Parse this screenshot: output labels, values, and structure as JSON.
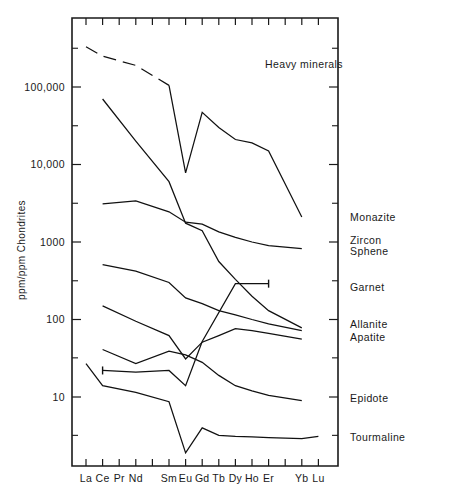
{
  "chart_data": {
    "type": "line",
    "title": "",
    "annotation": "Heavy minerals",
    "xlabel": "",
    "ylabel": "ppm/ppm Chondrites",
    "yscale": "log",
    "ylim": [
      1.5,
      600000
    ],
    "grid": false,
    "legend_position": "right-inline",
    "categories": [
      "La",
      "Ce",
      "Pr",
      "Nd",
      "Pm",
      "Sm",
      "Eu",
      "Gd",
      "Tb",
      "Dy",
      "Ho",
      "Er",
      "Tm",
      "Yb",
      "Lu"
    ],
    "tick_labels": [
      "La",
      "Ce",
      "Pr",
      "Nd",
      "",
      "Sm",
      "Eu",
      "Gd",
      "Tb",
      "Dy",
      "Ho",
      "Er",
      "",
      "Yb",
      "Lu"
    ],
    "y_tick_labels": [
      "100,000",
      "10,000",
      "1000",
      "100",
      "10"
    ],
    "y_tick_values": [
      100000,
      10000,
      1000,
      100,
      10
    ],
    "series": [
      {
        "name": "Monazite",
        "label": "Monazite",
        "dashed_head": true,
        "x": [
          "La",
          "Ce",
          "Nd",
          "Sm",
          "Eu",
          "Gd",
          "Tb",
          "Dy",
          "Ho",
          "Er",
          "Yb"
        ],
        "values": [
          330000,
          250000,
          190000,
          105000,
          7800,
          47000,
          30000,
          21000,
          19000,
          15000,
          2100
        ]
      },
      {
        "name": "Zircon",
        "label": "Zircon",
        "dashed_head": false,
        "x": [
          "Ce",
          "Nd",
          "Sm",
          "Eu",
          "Gd",
          "Tb",
          "Dy",
          "Ho",
          "Er",
          "Yb"
        ],
        "values": [
          70000,
          20000,
          6000,
          1750,
          1400,
          560,
          330,
          200,
          130,
          78
        ]
      },
      {
        "name": "Sphene",
        "label": "Sphene",
        "dashed_head": false,
        "x": [
          "Ce",
          "Nd",
          "Sm",
          "Eu",
          "Gd",
          "Tb",
          "Dy",
          "Ho",
          "Er",
          "Yb"
        ],
        "values": [
          3100,
          3400,
          2450,
          1800,
          1700,
          1350,
          1150,
          1000,
          900,
          820
        ]
      },
      {
        "name": "Garnet",
        "label": "Garnet",
        "dashed_head": false,
        "x": [
          "Ce",
          "Nd",
          "Sm",
          "Eu",
          "Gd",
          "Dy",
          "Er"
        ],
        "values": [
          22,
          21,
          22,
          14,
          52,
          290,
          290
        ],
        "has_endcap": true
      },
      {
        "name": "Allanite",
        "label": "Allanite",
        "dashed_head": false,
        "x": [
          "Ce",
          "Nd",
          "Sm",
          "Eu",
          "Gd",
          "Tb",
          "Dy",
          "Ho",
          "Er",
          "Yb"
        ],
        "values": [
          510,
          420,
          300,
          190,
          160,
          130,
          115,
          100,
          88,
          72
        ]
      },
      {
        "name": "Apatite",
        "label": "Apatite",
        "dashed_head": false,
        "x": [
          "Ce",
          "Nd",
          "Sm",
          "Eu",
          "Gd",
          "Tb",
          "Dy",
          "Ho",
          "Er",
          "Yb"
        ],
        "values": [
          150,
          95,
          62,
          31,
          51,
          62,
          76,
          72,
          66,
          56
        ]
      },
      {
        "name": "Epidote",
        "label": "Epidote",
        "dashed_head": false,
        "x": [
          "Ce",
          "Nd",
          "Sm",
          "Eu",
          "Gd",
          "Tb",
          "Dy",
          "Ho",
          "Er",
          "Yb"
        ],
        "values": [
          41,
          27,
          39,
          35,
          28,
          19,
          14,
          12,
          10.5,
          9
        ]
      },
      {
        "name": "Tourmaline",
        "label": "Tourmaline",
        "dashed_head": false,
        "x": [
          "La",
          "Ce",
          "Nd",
          "Sm",
          "Eu",
          "Gd",
          "Tb",
          "Dy",
          "Ho",
          "Er",
          "Yb",
          "Lu"
        ],
        "values": [
          27,
          14,
          11.5,
          8.7,
          1.9,
          4.0,
          3.2,
          3.1,
          3.05,
          3.0,
          2.9,
          3.1
        ]
      }
    ],
    "series_labels": [
      {
        "text": "Monazite",
        "y_value": 2100
      },
      {
        "text": "Zircon",
        "y_value": 1050
      },
      {
        "text": "Sphene",
        "y_value": 760
      },
      {
        "text": "Garnet",
        "y_value": 260
      },
      {
        "text": "Allanite",
        "y_value": 86
      },
      {
        "text": "Apatite",
        "y_value": 58
      },
      {
        "text": "Epidote",
        "y_value": 9.5
      },
      {
        "text": "Tourmaline",
        "y_value": 3.0
      }
    ]
  },
  "colors": {
    "ink": "#1a1a1a",
    "background": "#ffffff",
    "line": "#111111"
  }
}
